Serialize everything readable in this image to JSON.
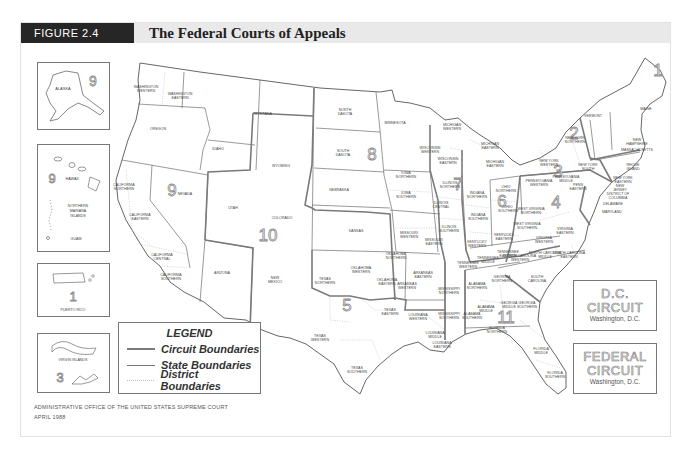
{
  "header": {
    "figure_tag": "FIGURE 2.4",
    "title": "The Federal Courts of Appeals"
  },
  "colors": {
    "header_tag_bg": "#262626",
    "header_bar_bg": "#e9e9e9",
    "circuit_line": "#7a7a7a",
    "state_line": "#555555",
    "district_line": "#b5b5b5"
  },
  "insets": {
    "alaska": {
      "label": "ALASKA",
      "circuit": "9"
    },
    "hawaii": {
      "labels": [
        "HAWAII",
        "NORTHERN MARIANA ISLANDS",
        "GUAM"
      ],
      "circuit": "9"
    },
    "puerto_rico": {
      "label": "PUERTO RICO",
      "circuit": "1"
    },
    "virgin_islands": {
      "label": "VIRGIN ISLANDS",
      "circuit": "3"
    }
  },
  "legend": {
    "title": "LEGEND",
    "items": [
      {
        "label": "Circuit Boundaries",
        "style": "thick"
      },
      {
        "label": "State Boundaries",
        "style": "thin"
      },
      {
        "label": "District Boundaries",
        "style": "dotted"
      }
    ]
  },
  "dc_circuit": {
    "line1": "D.C.",
    "line2": "CIRCUIT",
    "city": "Washington, D.C."
  },
  "federal_circuit": {
    "line1": "FEDERAL",
    "line2": "CIRCUIT",
    "city": "Washington, D.C."
  },
  "footer": {
    "source": "ADMINISTRATIVE OFFICE OF THE UNITED STATES SUPREME COURT",
    "date": "APRIL 1988"
  },
  "circuit_numbers": [
    {
      "n": "1",
      "x": 658,
      "y": 76
    },
    {
      "n": "2",
      "x": 574,
      "y": 139
    },
    {
      "n": "3",
      "x": 558,
      "y": 177
    },
    {
      "n": "4",
      "x": 556,
      "y": 208
    },
    {
      "n": "5",
      "x": 347,
      "y": 311
    },
    {
      "n": "6",
      "x": 502,
      "y": 207
    },
    {
      "n": "7",
      "x": 458,
      "y": 190
    },
    {
      "n": "8",
      "x": 372,
      "y": 160
    },
    {
      "n": "9",
      "x": 172,
      "y": 196
    },
    {
      "n": "10",
      "x": 268,
      "y": 241
    },
    {
      "n": "11",
      "x": 506,
      "y": 323
    }
  ],
  "districts": [
    {
      "t": "WASHINGTON WESTERN",
      "x": 146,
      "y": 90
    },
    {
      "t": "WASHINGTON EASTERN",
      "x": 180,
      "y": 97
    },
    {
      "t": "OREGON",
      "x": 158,
      "y": 130
    },
    {
      "t": "IDAHO",
      "x": 218,
      "y": 150
    },
    {
      "t": "MONTANA",
      "x": 263,
      "y": 115
    },
    {
      "t": "WYOMING",
      "x": 281,
      "y": 167
    },
    {
      "t": "NORTH DAKOTA",
      "x": 345,
      "y": 113
    },
    {
      "t": "SOUTH DAKOTA",
      "x": 343,
      "y": 154
    },
    {
      "t": "NEBRASKA",
      "x": 339,
      "y": 191
    },
    {
      "t": "MINNESOTA",
      "x": 395,
      "y": 124
    },
    {
      "t": "NEVADA",
      "x": 185,
      "y": 195
    },
    {
      "t": "CALIFORNIA NORTHERN",
      "x": 124,
      "y": 188
    },
    {
      "t": "CALIFORNIA EASTERN",
      "x": 140,
      "y": 218
    },
    {
      "t": "CALIFORNIA CENTRAL",
      "x": 162,
      "y": 258
    },
    {
      "t": "CALIFORNIA SOUTHERN",
      "x": 171,
      "y": 278
    },
    {
      "t": "UTAH",
      "x": 233,
      "y": 209
    },
    {
      "t": "COLORADO",
      "x": 282,
      "y": 219
    },
    {
      "t": "KANSAS",
      "x": 356,
      "y": 232
    },
    {
      "t": "ARIZONA",
      "x": 222,
      "y": 274
    },
    {
      "t": "NEW MEXICO",
      "x": 275,
      "y": 281
    },
    {
      "t": "IOWA NORTHERN",
      "x": 406,
      "y": 176
    },
    {
      "t": "IOWA SOUTHERN",
      "x": 406,
      "y": 196
    },
    {
      "t": "MISSOURI WESTERN",
      "x": 409,
      "y": 236
    },
    {
      "t": "MISSOURI EASTERN",
      "x": 434,
      "y": 243
    },
    {
      "t": "WISCONSIN WESTERN",
      "x": 430,
      "y": 151
    },
    {
      "t": "WISCONSIN EASTERN",
      "x": 448,
      "y": 162
    },
    {
      "t": "MICHIGAN WESTERN",
      "x": 452,
      "y": 128
    },
    {
      "t": "MICHIGAN EASTERN",
      "x": 495,
      "y": 165
    },
    {
      "t": "ILLINOIS NORTHERN",
      "x": 450,
      "y": 186
    },
    {
      "t": "ILLINOIS CENTRAL",
      "x": 441,
      "y": 206
    },
    {
      "t": "ILLINOIS SOUTHERN",
      "x": 449,
      "y": 230
    },
    {
      "t": "INDIANA NORTHERN",
      "x": 477,
      "y": 196
    },
    {
      "t": "INDIANA SOUTHERN",
      "x": 478,
      "y": 218
    },
    {
      "t": "OHIO NORTHERN",
      "x": 506,
      "y": 190
    },
    {
      "t": "OHIO SOUTHERN",
      "x": 508,
      "y": 210
    },
    {
      "t": "KENTUCKY WESTERN",
      "x": 477,
      "y": 245
    },
    {
      "t": "KENTUCKY EASTERN",
      "x": 504,
      "y": 238
    },
    {
      "t": "TENNESSEE WESTERN",
      "x": 468,
      "y": 266
    },
    {
      "t": "TENNESSEE MIDDLE",
      "x": 488,
      "y": 261
    },
    {
      "t": "TENNESSEE EASTERN",
      "x": 508,
      "y": 255
    },
    {
      "t": "MICHIGAN EASTERN",
      "x": 490,
      "y": 147
    },
    {
      "t": "NEW YORK WESTERN",
      "x": 549,
      "y": 164
    },
    {
      "t": "NEW YORK NORTHERN",
      "x": 575,
      "y": 141
    },
    {
      "t": "NEW YORK EASTERN",
      "x": 623,
      "y": 181
    },
    {
      "t": "NEW YORK SOUTH",
      "x": 588,
      "y": 168
    },
    {
      "t": "PENNSYLVANIA WESTERN",
      "x": 539,
      "y": 184
    },
    {
      "t": "PENNSYLVANIA MIDDLE",
      "x": 566,
      "y": 180
    },
    {
      "t": "PENN EASTERN",
      "x": 578,
      "y": 188
    },
    {
      "t": "VERMONT",
      "x": 593,
      "y": 117
    },
    {
      "t": "MAINE",
      "x": 646,
      "y": 110
    },
    {
      "t": "NEW HAMPSHIRE",
      "x": 637,
      "y": 143
    },
    {
      "t": "MASSACHUSETTS",
      "x": 637,
      "y": 151
    },
    {
      "t": "RHODE ISLAND",
      "x": 633,
      "y": 168
    },
    {
      "t": "NEW JERSEY",
      "x": 620,
      "y": 189
    },
    {
      "t": "DISTRICT OF COLUMBIA",
      "x": 618,
      "y": 197
    },
    {
      "t": "DELAWARE",
      "x": 613,
      "y": 205
    },
    {
      "t": "MARYLAND",
      "x": 612,
      "y": 213
    },
    {
      "t": "WEST VIRGINIA NORTHERN",
      "x": 531,
      "y": 212
    },
    {
      "t": "WEST VIRGINIA SOUTHERN",
      "x": 527,
      "y": 227
    },
    {
      "t": "VIRGINIA EASTERN",
      "x": 565,
      "y": 232
    },
    {
      "t": "VIRGINIA WESTERN",
      "x": 544,
      "y": 241
    },
    {
      "t": "NORTH CAROLINA WESTERN",
      "x": 520,
      "y": 259
    },
    {
      "t": "NORTH CAROLINA MIDDLE",
      "x": 545,
      "y": 256
    },
    {
      "t": "NORTH CAROLINA EASTERN",
      "x": 569,
      "y": 256
    },
    {
      "t": "SOUTH CAROLINA",
      "x": 537,
      "y": 280
    },
    {
      "t": "GEORGIA NORTHERN",
      "x": 502,
      "y": 280
    },
    {
      "t": "GEORGIA MIDDLE",
      "x": 509,
      "y": 306
    },
    {
      "t": "GEORGIA SOUTHERN",
      "x": 527,
      "y": 306
    },
    {
      "t": "ALABAMA NORTHERN",
      "x": 477,
      "y": 287
    },
    {
      "t": "ALABAMA MIDDLE",
      "x": 486,
      "y": 310
    },
    {
      "t": "ALABAMA SOUTHERN",
      "x": 472,
      "y": 317
    },
    {
      "t": "MISSISSIPPI NORTHERN",
      "x": 449,
      "y": 292
    },
    {
      "t": "MISSISSIPPI SOUTHERN",
      "x": 449,
      "y": 317
    },
    {
      "t": "FLORIDA NORTHERN",
      "x": 497,
      "y": 331
    },
    {
      "t": "FLORIDA MIDDLE",
      "x": 541,
      "y": 352
    },
    {
      "t": "FLORIDA SOUTHERN",
      "x": 555,
      "y": 376
    },
    {
      "t": "LOUISIANA WESTERN",
      "x": 418,
      "y": 318
    },
    {
      "t": "LOUISIANA MIDDLE",
      "x": 435,
      "y": 336
    },
    {
      "t": "LOUISIANA EASTERN",
      "x": 442,
      "y": 346
    },
    {
      "t": "ARKANSAS EASTERN",
      "x": 423,
      "y": 276
    },
    {
      "t": "ARKANSAS WESTERN",
      "x": 407,
      "y": 287
    },
    {
      "t": "OKLAHOMA NORTHERN",
      "x": 396,
      "y": 257
    },
    {
      "t": "OKLAHOMA WESTERN",
      "x": 361,
      "y": 271
    },
    {
      "t": "OKLAHOMA EASTERN",
      "x": 387,
      "y": 283
    },
    {
      "t": "TEXAS NORTHERN",
      "x": 325,
      "y": 282
    },
    {
      "t": "TEXAS EASTERN",
      "x": 390,
      "y": 313
    },
    {
      "t": "TEXAS WESTERN",
      "x": 320,
      "y": 339
    },
    {
      "t": "TEXAS SOUTHERN",
      "x": 357,
      "y": 371
    }
  ]
}
